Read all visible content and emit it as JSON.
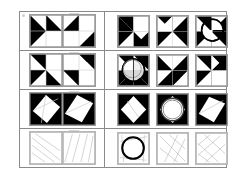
{
  "plate": {
    "title": "visual-analogy-matrix-plate",
    "description": "Four-row geometric pattern matrix puzzle plate",
    "frame_color": "#8a8a8a",
    "tile_border_color": "#9a9a9a",
    "fill_black": "#000000",
    "fill_white": "#ffffff",
    "line_gray": "#b4b4b4",
    "rows": [
      {
        "id": "row-1",
        "problem": {
          "label": "row-1-problem-pair",
          "tiles": [
            {
              "id": "r1p1",
              "pattern": "two-black-triangles-diagonal",
              "fill": "black-white"
            },
            {
              "id": "r1p2",
              "pattern": "two-black-triangles-offset",
              "fill": "black-white"
            }
          ]
        },
        "options": [
          {
            "id": "r1o1",
            "pattern": "black-triangles-left-arrow",
            "fill": "black-white",
            "has_circle": false
          },
          {
            "id": "r1o2",
            "pattern": "bowtie-hourglass-black",
            "fill": "black-white",
            "has_circle": false
          },
          {
            "id": "r1o3",
            "pattern": "pinwheel-with-circle",
            "fill": "black-white",
            "has_circle": true
          }
        ]
      },
      {
        "id": "row-2",
        "problem": {
          "label": "row-2-problem-pair",
          "tiles": [
            {
              "id": "r2p1",
              "pattern": "pinwheel-quarter-black",
              "fill": "black-white"
            },
            {
              "id": "r2p2",
              "pattern": "pinwheel-quarter-black-mirrored",
              "fill": "black-white"
            }
          ]
        },
        "options": [
          {
            "id": "r2o1",
            "pattern": "pinwheel-with-double-circle",
            "fill": "black-white",
            "has_circle": true
          },
          {
            "id": "r2o2",
            "pattern": "four-black-triangles-pinwheel",
            "fill": "black-white",
            "has_circle": false
          },
          {
            "id": "r2o3",
            "pattern": "black-triangles-corner",
            "fill": "black-white",
            "has_circle": false
          }
        ]
      },
      {
        "id": "row-3",
        "problem": {
          "label": "row-3-problem-pair",
          "tiles": [
            {
              "id": "r3p1",
              "pattern": "black-square-with-white-diamond-lines",
              "fill": "black-white"
            },
            {
              "id": "r3p2",
              "pattern": "black-square-with-white-diamond",
              "fill": "black-white"
            }
          ]
        },
        "options": [
          {
            "id": "r3o1",
            "pattern": "black-square-white-diamond-split",
            "fill": "black-white",
            "has_circle": false
          },
          {
            "id": "r3o2",
            "pattern": "black-square-white-circle-ring",
            "fill": "black-white",
            "has_circle": true
          },
          {
            "id": "r3o3",
            "pattern": "black-square-white-tilted-square",
            "fill": "black-white",
            "has_circle": false
          }
        ]
      },
      {
        "id": "row-4",
        "problem": {
          "label": "row-4-problem-pair",
          "tiles": [
            {
              "id": "r4p1",
              "pattern": "gray-line-diagonals-left",
              "fill": "outline"
            },
            {
              "id": "r4p2",
              "pattern": "gray-line-diagonals-right",
              "fill": "outline"
            }
          ]
        },
        "options": [
          {
            "id": "r4o1",
            "pattern": "outline-square-with-bold-circle",
            "fill": "outline",
            "has_circle": true
          },
          {
            "id": "r4o2",
            "pattern": "outline-square-diagonal-lines",
            "fill": "outline",
            "has_circle": false
          },
          {
            "id": "r4o3",
            "pattern": "outline-square-crossing-lines",
            "fill": "outline",
            "has_circle": false
          }
        ]
      }
    ]
  }
}
